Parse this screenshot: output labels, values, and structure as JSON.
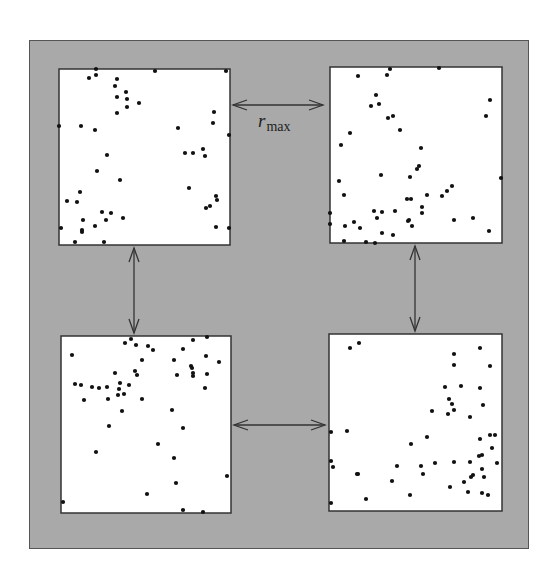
{
  "diagram": {
    "background_color": "#a9a9a9",
    "panel_color": "#ffffff",
    "point_color": "#111111",
    "label": {
      "main": "r",
      "subscript": "max"
    },
    "panels": [
      {
        "name": "top-left",
        "x": 59,
        "y": 69,
        "w": 171,
        "h": 176,
        "points": [
          [
            37,
            0
          ],
          [
            96,
            2
          ],
          [
            167,
            2
          ],
          [
            30,
            9
          ],
          [
            37,
            6
          ],
          [
            58,
            10
          ],
          [
            56,
            17
          ],
          [
            67,
            23
          ],
          [
            58,
            28
          ],
          [
            68,
            30
          ],
          [
            80,
            34
          ],
          [
            68,
            38
          ],
          [
            58,
            44
          ],
          [
            155,
            43
          ],
          [
            154,
            54
          ],
          [
            0,
            57
          ],
          [
            22,
            57
          ],
          [
            36,
            61
          ],
          [
            119,
            59
          ],
          [
            170,
            66
          ],
          [
            144,
            80
          ],
          [
            126,
            84
          ],
          [
            134,
            84
          ],
          [
            146,
            87
          ],
          [
            48,
            86
          ],
          [
            38,
            102
          ],
          [
            61,
            111
          ],
          [
            130,
            119
          ],
          [
            21,
            123
          ],
          [
            8,
            132
          ],
          [
            18,
            133
          ],
          [
            157,
            127
          ],
          [
            158,
            131
          ],
          [
            151,
            137
          ],
          [
            147,
            139
          ],
          [
            43,
            143
          ],
          [
            52,
            144
          ],
          [
            24,
            151
          ],
          [
            47,
            151
          ],
          [
            64,
            149
          ],
          [
            2,
            159
          ],
          [
            23,
            161
          ],
          [
            23,
            163
          ],
          [
            36,
            157
          ],
          [
            157,
            158
          ],
          [
            170,
            159
          ],
          [
            16,
            173
          ],
          [
            45,
            173
          ]
        ]
      },
      {
        "name": "top-right",
        "x": 330,
        "y": 67,
        "w": 172,
        "h": 176,
        "points": [
          [
            60,
            2
          ],
          [
            57,
            8
          ],
          [
            109,
            1
          ],
          [
            28,
            9
          ],
          [
            46,
            28
          ],
          [
            49,
            37
          ],
          [
            41,
            39
          ],
          [
            160,
            33
          ],
          [
            156,
            49
          ],
          [
            58,
            51
          ],
          [
            63,
            49
          ],
          [
            70,
            63
          ],
          [
            20,
            66
          ],
          [
            11,
            78
          ],
          [
            91,
            81
          ],
          [
            89,
            99
          ],
          [
            87,
            102
          ],
          [
            51,
            108
          ],
          [
            80,
            110
          ],
          [
            171,
            111
          ],
          [
            9,
            114
          ],
          [
            14,
            128
          ],
          [
            122,
            119
          ],
          [
            117,
            124
          ],
          [
            112,
            129
          ],
          [
            97,
            128
          ],
          [
            77,
            132
          ],
          [
            81,
            132
          ],
          [
            44,
            144
          ],
          [
            52,
            145
          ],
          [
            65,
            144
          ],
          [
            92,
            140
          ],
          [
            92,
            146
          ],
          [
            0,
            146
          ],
          [
            0,
            157
          ],
          [
            47,
            151
          ],
          [
            15,
            159
          ],
          [
            24,
            155
          ],
          [
            30,
            161
          ],
          [
            78,
            154
          ],
          [
            79,
            153
          ],
          [
            82,
            159
          ],
          [
            124,
            153
          ],
          [
            143,
            151
          ],
          [
            159,
            164
          ],
          [
            52,
            166
          ],
          [
            63,
            168
          ],
          [
            14,
            174
          ],
          [
            36,
            175
          ],
          [
            45,
            176
          ]
        ]
      },
      {
        "name": "bottom-left",
        "x": 61,
        "y": 336,
        "w": 170,
        "h": 177,
        "points": [
          [
            70,
            3
          ],
          [
            64,
            7
          ],
          [
            75,
            9
          ],
          [
            87,
            10
          ],
          [
            92,
            14
          ],
          [
            132,
            4
          ],
          [
            146,
            1
          ],
          [
            122,
            13
          ],
          [
            11,
            19
          ],
          [
            145,
            20
          ],
          [
            158,
            26
          ],
          [
            81,
            24
          ],
          [
            113,
            24
          ],
          [
            130,
            30
          ],
          [
            131,
            32
          ],
          [
            54,
            37
          ],
          [
            74,
            35
          ],
          [
            76,
            39
          ],
          [
            116,
            39
          ],
          [
            132,
            37
          ],
          [
            132,
            40
          ],
          [
            146,
            38
          ],
          [
            14,
            48
          ],
          [
            20,
            49
          ],
          [
            31,
            51
          ],
          [
            38,
            52
          ],
          [
            46,
            51
          ],
          [
            59,
            47
          ],
          [
            68,
            49
          ],
          [
            58,
            53
          ],
          [
            57,
            59
          ],
          [
            63,
            58
          ],
          [
            144,
            52
          ],
          [
            23,
            64
          ],
          [
            47,
            63
          ],
          [
            81,
            63
          ],
          [
            61,
            75
          ],
          [
            111,
            74
          ],
          [
            48,
            90
          ],
          [
            122,
            92
          ],
          [
            97,
            108
          ],
          [
            35,
            116
          ],
          [
            113,
            122
          ],
          [
            166,
            140
          ],
          [
            115,
            147
          ],
          [
            86,
            158
          ],
          [
            2,
            166
          ],
          [
            122,
            174
          ],
          [
            142,
            176
          ]
        ]
      },
      {
        "name": "bottom-right",
        "x": 329,
        "y": 334,
        "w": 173,
        "h": 177,
        "points": [
          [
            21,
            14
          ],
          [
            30,
            9
          ],
          [
            125,
            20
          ],
          [
            151,
            14
          ],
          [
            125,
            31
          ],
          [
            161,
            32
          ],
          [
            116,
            53
          ],
          [
            132,
            52
          ],
          [
            151,
            54
          ],
          [
            120,
            65
          ],
          [
            123,
            70
          ],
          [
            154,
            71
          ],
          [
            125,
            76
          ],
          [
            119,
            80
          ],
          [
            103,
            77
          ],
          [
            141,
            83
          ],
          [
            2,
            98
          ],
          [
            18,
            97
          ],
          [
            161,
            101
          ],
          [
            166,
            101
          ],
          [
            98,
            103
          ],
          [
            151,
            105
          ],
          [
            82,
            110
          ],
          [
            163,
            114
          ],
          [
            150,
            122
          ],
          [
            153,
            121
          ],
          [
            2,
            127
          ],
          [
            4,
            133
          ],
          [
            68,
            132
          ],
          [
            92,
            132
          ],
          [
            106,
            129
          ],
          [
            125,
            128
          ],
          [
            141,
            128
          ],
          [
            168,
            129
          ],
          [
            153,
            135
          ],
          [
            28,
            140
          ],
          [
            29,
            140
          ],
          [
            94,
            140
          ],
          [
            63,
            147
          ],
          [
            144,
            141
          ],
          [
            142,
            143
          ],
          [
            155,
            143
          ],
          [
            135,
            148
          ],
          [
            121,
            153
          ],
          [
            139,
            158
          ],
          [
            153,
            159
          ],
          [
            159,
            161
          ],
          [
            81,
            161
          ],
          [
            37,
            165
          ],
          [
            2,
            169
          ]
        ]
      }
    ],
    "arrows": [
      {
        "name": "top-horizontal",
        "x1": 233,
        "y1": 105,
        "x2": 323,
        "y2": 105
      },
      {
        "name": "left-vertical",
        "x1": 134,
        "y1": 248,
        "x2": 134,
        "y2": 333
      },
      {
        "name": "right-vertical",
        "x1": 415,
        "y1": 246,
        "x2": 415,
        "y2": 331
      },
      {
        "name": "bottom-horizontal",
        "x1": 234,
        "y1": 425,
        "x2": 325,
        "y2": 425
      }
    ]
  }
}
